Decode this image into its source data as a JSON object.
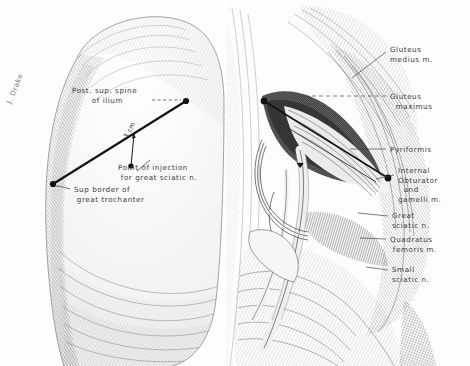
{
  "figure": {
    "background_color": "#fefefe",
    "ink_color": "#2f2f2f",
    "hatch_color": "#6b6b6b",
    "label_color": "#3b3b3b",
    "signature": "J. Drake"
  },
  "left_panel": {
    "name": "surface-landmark-diagram",
    "labels": [
      {
        "id": "psis",
        "text": "Post. sup. spine\n       of ilium",
        "x": 72,
        "y": 86
      },
      {
        "id": "injection-point",
        "text": "Point of injection\n for great sciatic n.",
        "x": 118,
        "y": 163
      },
      {
        "id": "trochanter",
        "text": "Sup border of\n great trochanter",
        "x": 74,
        "y": 185
      }
    ],
    "measure": {
      "text": "3 cm",
      "from": "landmark-line",
      "to": "injection-point"
    },
    "landmark_line": {
      "from_label": "Post. sup. spine of ilium",
      "to_label": "Sup border of great trochanter",
      "x1": 186,
      "y1": 101,
      "x2": 53,
      "y2": 184
    },
    "injection_marker": {
      "x": 131,
      "y": 166
    }
  },
  "right_panel": {
    "name": "deep-dissection-diagram",
    "labels": [
      {
        "id": "gluteus-medius",
        "text": "Gluteus\nmedius m.",
        "x": 390,
        "y": 45,
        "leader": [
          [
            388,
            52
          ],
          [
            352,
            77
          ]
        ]
      },
      {
        "id": "gluteus-maximus",
        "text": "Gluteus\n  maximus",
        "x": 390,
        "y": 92,
        "leader": [
          [
            388,
            96
          ],
          [
            300,
            96
          ]
        ]
      },
      {
        "id": "pyriformis",
        "text": "Pyriformis",
        "x": 390,
        "y": 146,
        "leader": [
          [
            388,
            149
          ],
          [
            352,
            149
          ]
        ]
      },
      {
        "id": "internal-obturator",
        "text": "Internal\nObturator\n  and\ngamelli m.",
        "x": 398,
        "y": 167,
        "leader": [
          [
            396,
            175
          ],
          [
            378,
            178
          ]
        ]
      },
      {
        "id": "great-sciatic",
        "text": "Great\nsciatic n.",
        "x": 392,
        "y": 212,
        "leader": [
          [
            390,
            216
          ],
          [
            360,
            214
          ]
        ]
      },
      {
        "id": "quadratus-femoris",
        "text": "Quadratus\n femoris m.",
        "x": 390,
        "y": 236,
        "leader": [
          [
            388,
            239
          ],
          [
            362,
            238
          ]
        ]
      },
      {
        "id": "small-sciatic",
        "text": "Small\nsciatic n.",
        "x": 392,
        "y": 266,
        "leader": [
          [
            390,
            270
          ],
          [
            368,
            268
          ]
        ]
      }
    ],
    "needle": {
      "from": [
        264,
        101
      ],
      "to": [
        388,
        178
      ]
    }
  }
}
